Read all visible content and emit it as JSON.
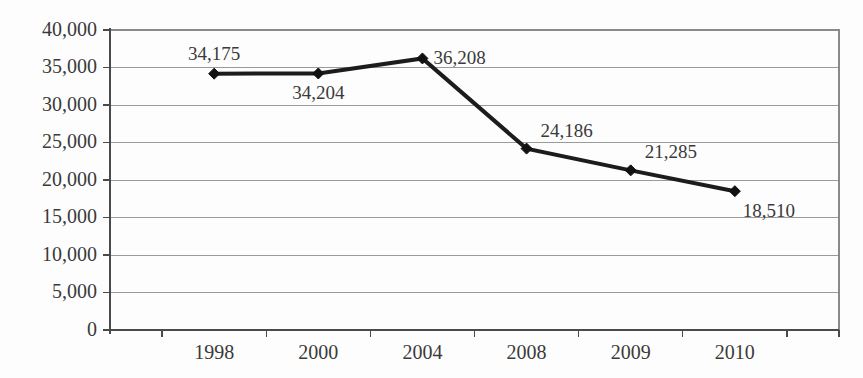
{
  "chart_data": {
    "type": "line",
    "title": "",
    "subtitle": "",
    "xlabel": "",
    "ylabel": "",
    "categories": [
      "1998",
      "2000",
      "2004",
      "2008",
      "2009",
      "2010"
    ],
    "values": [
      34175,
      34204,
      36208,
      24186,
      21285,
      18510
    ],
    "point_labels": [
      "34,175",
      "34,204",
      "36,208",
      "24,186",
      "21,285",
      "18,510"
    ],
    "label_positions": [
      "above",
      "below",
      "right",
      "above-right",
      "above-right",
      "below-right"
    ],
    "ylim": [
      0,
      40000
    ],
    "ytick_values": [
      0,
      5000,
      10000,
      15000,
      20000,
      25000,
      30000,
      35000,
      40000
    ],
    "ytick_labels": [
      "0",
      "5,000",
      "10,000",
      "15,000",
      "20,000",
      "25,000",
      "30,000",
      "35,000",
      "40,000"
    ],
    "grid": true,
    "grid_axis": "y",
    "legend": false,
    "legend_position": "none",
    "marker": "diamond",
    "series": [
      {
        "name": "",
        "values": [
          34175,
          34204,
          36208,
          24186,
          21285,
          18510
        ]
      }
    ],
    "colors": {
      "line": "#1c1c1c",
      "marker": "#111111",
      "gridline": "#9a9a9a",
      "axis": "#4a4a4a",
      "text": "#3a3a3a",
      "background": "#fdfdfd"
    }
  }
}
